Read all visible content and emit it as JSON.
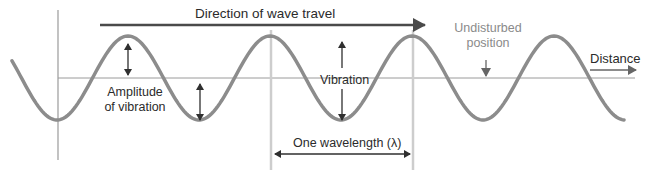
{
  "diagram": {
    "labels": {
      "direction": "Direction of wave travel",
      "undisturbed_line1": "Undisturbed",
      "undisturbed_line2": "position",
      "distance": "Distance",
      "amplitude_line1": "Amplitude",
      "amplitude_line2": "of vibration",
      "vibration": "Vibration",
      "wavelength": "One wavelength (λ)"
    },
    "colors": {
      "wave": "#8c8c8c",
      "axis": "#9a9a9a",
      "arrow": "#3a3a3a",
      "marker_line": "#c8c8c8",
      "text": "#2b2b2b",
      "text_muted": "#8a8a8a"
    },
    "wave": {
      "baseline_y": 78,
      "amplitude_px": 42,
      "wavelength_px": 142,
      "peaks_x": [
        128,
        271,
        413,
        555
      ],
      "troughs_x": [
        58,
        199,
        342,
        485
      ]
    }
  }
}
